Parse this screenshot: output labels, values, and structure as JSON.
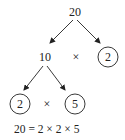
{
  "diagram": {
    "type": "factor-tree",
    "root": "20",
    "level1": {
      "left": "10",
      "op": "×",
      "right": "2"
    },
    "level2": {
      "left": "2",
      "op": "×",
      "right": "5"
    },
    "equation": "20 = 2 × 2 × 5",
    "circled": [
      "2",
      "2",
      "5"
    ],
    "colors": {
      "ink": "#222222",
      "background": "#ffffff"
    }
  }
}
